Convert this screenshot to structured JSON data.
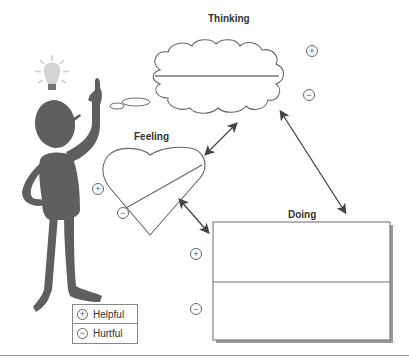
{
  "diagram": {
    "nodes": {
      "thinking": {
        "title": "Thinking",
        "plus": "+",
        "minus": "−"
      },
      "feeling": {
        "title": "Feeling",
        "plus": "+",
        "minus": "−"
      },
      "doing": {
        "title": "Doing",
        "plus": "+",
        "minus": "−"
      }
    },
    "connections": [
      {
        "from": "Thinking",
        "to": "Feeling",
        "type": "bidirectional"
      },
      {
        "from": "Thinking",
        "to": "Doing",
        "type": "bidirectional"
      },
      {
        "from": "Feeling",
        "to": "Doing",
        "type": "bidirectional"
      }
    ],
    "legend": [
      {
        "symbol": "+",
        "label": "Helpful"
      },
      {
        "symbol": "−",
        "label": "Hurtful"
      }
    ],
    "figure": {
      "description": "person-with-lightbulb-idea"
    },
    "colors": {
      "stroke": "#555555",
      "figure": "#5f5f5f",
      "arrow": "#444444"
    }
  }
}
